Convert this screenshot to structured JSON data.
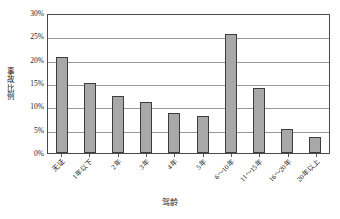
{
  "chart_data": {
    "type": "bar",
    "title": "",
    "xlabel": "驾龄",
    "ylabel": "事故比例",
    "categories": [
      "无证",
      "1年以下",
      "2年",
      "3年",
      "4年",
      "5年",
      "6～10年",
      "11～15年",
      "16～20年",
      "20年以上"
    ],
    "values": [
      20.5,
      15.0,
      12.2,
      11.0,
      8.5,
      8.0,
      25.5,
      14.0,
      5.2,
      3.4
    ],
    "ylim": [
      0,
      30
    ],
    "ytick_values": [
      0,
      5,
      10,
      15,
      20,
      25,
      30
    ],
    "ytick_labels": [
      "0%",
      "5%",
      "10%",
      "15%",
      "20%",
      "25%",
      "30%"
    ],
    "grid": "horizontal",
    "legend": "none",
    "bar_color": "#a8a8a8",
    "bar_border_color": "#3d3d3d",
    "gridline_color": "#9a9a9a",
    "axis_color": "#4a4a4a",
    "background": "#ffffff"
  }
}
